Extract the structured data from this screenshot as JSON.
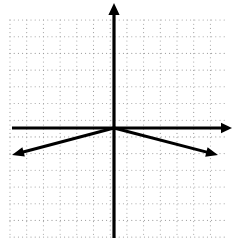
{
  "figure": {
    "name": "coordinate-plane-absolute-value-graph",
    "width": 234,
    "height": 242,
    "background_color": "#ffffff"
  },
  "grid": {
    "style": "dotted",
    "color": "#9a9a9a",
    "dot_radius": 0.55,
    "dot_step": 4.2,
    "cell_size": 16.7,
    "x_start": 10,
    "x_end": 226,
    "y_start": 20,
    "y_end": 238,
    "columns": 13,
    "rows": 13
  },
  "axes": {
    "color": "#000000",
    "stroke_width": 3.2,
    "origin": {
      "x": 114,
      "y": 128
    },
    "x_axis": {
      "label": "x-axis",
      "y": 128,
      "x_left": 12,
      "x_right": 232,
      "arrow_left": false,
      "arrow_right": true
    },
    "y_axis": {
      "label": "y-axis",
      "x": 114,
      "y_top": 3,
      "y_bottom": 238,
      "arrow_top": true,
      "arrow_bottom": false
    }
  },
  "chart_data": {
    "type": "line",
    "title": "",
    "xlabel": "",
    "ylabel": "",
    "grid": true,
    "legend": "none",
    "function": "y = -0.27|x|",
    "vertex": {
      "x": 0,
      "y": 0
    },
    "series": [
      {
        "name": "left-branch",
        "slope": 0.265,
        "points_px": [
          {
            "x": 114,
            "y": 128
          },
          {
            "x": 12,
            "y": 155
          }
        ],
        "points_units": [
          {
            "x": 0,
            "y": 0
          },
          {
            "x": -6.1,
            "y": -1.6
          }
        ],
        "arrow_end": true
      },
      {
        "name": "right-branch",
        "slope": -0.26,
        "points_px": [
          {
            "x": 114,
            "y": 128
          },
          {
            "x": 218,
            "y": 155
          }
        ],
        "points_units": [
          {
            "x": 0,
            "y": 0
          },
          {
            "x": 6.2,
            "y": -1.6
          }
        ],
        "arrow_end": true
      }
    ],
    "curve_color": "#000000",
    "curve_stroke_width": 3.0,
    "xlim": [
      -6.8,
      7.1
    ],
    "ylim": [
      -6.6,
      7.5
    ]
  }
}
